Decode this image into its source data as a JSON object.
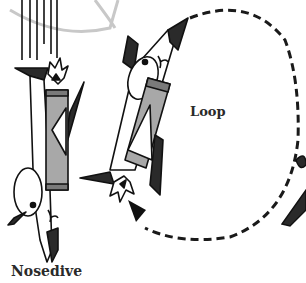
{
  "labels": {
    "loop": "Loop",
    "nosedive": "Nosedive"
  },
  "colors": {
    "outline": "#111111",
    "body_fill": "#ffffff",
    "fin_fill": "#2a2a2a",
    "tube_fill": "#a8a8a8",
    "tube_dark": "#7a7a7a",
    "dashed_path": "#1a1a1a",
    "bg_arc": "#c8c8c8"
  },
  "elements": {
    "rockets": [
      "nosedive-rocket",
      "loop-rocket",
      "partial-rocket-right"
    ],
    "path_style": "dashed",
    "arrow": "arrowhead-pointing-up-left"
  }
}
